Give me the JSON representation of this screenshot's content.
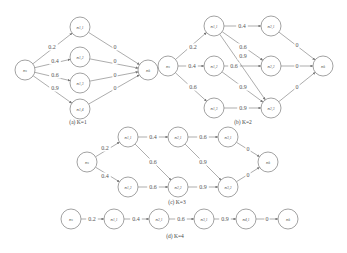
{
  "figure": {
    "node_radius": 10,
    "colors": {
      "stroke": "#8a8a8a",
      "text": "#555555",
      "background": "#ffffff"
    },
    "subfigures": [
      {
        "id": "a",
        "caption": "(a) K=1",
        "caption_pos": [
          78,
          124
        ],
        "nodes": [
          {
            "id": "ns",
            "label": "ns",
            "x": 25,
            "y": 70
          },
          {
            "id": "n11",
            "label": "n1,1",
            "x": 80,
            "y": 27
          },
          {
            "id": "n12",
            "label": "n1,2",
            "x": 80,
            "y": 57
          },
          {
            "id": "n13",
            "label": "n1,3",
            "x": 80,
            "y": 83
          },
          {
            "id": "n14",
            "label": "n1,4",
            "x": 80,
            "y": 109
          },
          {
            "id": "nk",
            "label": "nk",
            "x": 148,
            "y": 70
          }
        ],
        "edges": [
          {
            "from": "ns",
            "to": "n11",
            "label": "0.2",
            "lx": 52,
            "ly": 47
          },
          {
            "from": "ns",
            "to": "n12",
            "label": "0.4",
            "lx": 55,
            "ly": 61
          },
          {
            "from": "ns",
            "to": "n13",
            "label": "0.6",
            "lx": 55,
            "ly": 75
          },
          {
            "from": "ns",
            "to": "n14",
            "label": "0.9",
            "lx": 55,
            "ly": 88
          },
          {
            "from": "n11",
            "to": "nk",
            "label": "0",
            "lx": 115,
            "ly": 47
          },
          {
            "from": "n12",
            "to": "nk",
            "label": "0",
            "lx": 115,
            "ly": 61
          },
          {
            "from": "n13",
            "to": "nk",
            "label": "0",
            "lx": 115,
            "ly": 75
          },
          {
            "from": "n14",
            "to": "nk",
            "label": "0",
            "lx": 115,
            "ly": 88
          }
        ]
      },
      {
        "id": "b",
        "caption": "(b) K=2",
        "caption_pos": [
          243,
          124
        ],
        "nodes": [
          {
            "id": "ns",
            "label": "ns",
            "x": 168,
            "y": 66
          },
          {
            "id": "n11",
            "label": "n1,1",
            "x": 214,
            "y": 26
          },
          {
            "id": "n12",
            "label": "n1,2",
            "x": 214,
            "y": 66
          },
          {
            "id": "n13",
            "label": "n1,3",
            "x": 214,
            "y": 108
          },
          {
            "id": "n21",
            "label": "n2,1",
            "x": 271,
            "y": 26
          },
          {
            "id": "n22",
            "label": "n2,2",
            "x": 271,
            "y": 66
          },
          {
            "id": "n23",
            "label": "n2,3",
            "x": 271,
            "y": 108
          },
          {
            "id": "nk",
            "label": "nk",
            "x": 323,
            "y": 66
          }
        ],
        "edges": [
          {
            "from": "ns",
            "to": "n11",
            "label": "0.2",
            "lx": 193,
            "ly": 47
          },
          {
            "from": "ns",
            "to": "n12",
            "label": "0.4",
            "lx": 192,
            "ly": 66
          },
          {
            "from": "ns",
            "to": "n13",
            "label": "0.6",
            "lx": 193,
            "ly": 87
          },
          {
            "from": "n11",
            "to": "n21",
            "label": "0.4",
            "lx": 242,
            "ly": 26
          },
          {
            "from": "n11",
            "to": "n22",
            "label": "0.6",
            "lx": 243,
            "ly": 47
          },
          {
            "from": "n11",
            "to": "n23",
            "label": "0.9",
            "lx": 243,
            "ly": 56
          },
          {
            "from": "n12",
            "to": "n22",
            "label": "0.6",
            "lx": 234,
            "ly": 66
          },
          {
            "from": "n12",
            "to": "n23",
            "label": "0.9",
            "lx": 243,
            "ly": 87
          },
          {
            "from": "n13",
            "to": "n23",
            "label": "0.9",
            "lx": 243,
            "ly": 108
          },
          {
            "from": "n21",
            "to": "nk",
            "label": "0",
            "lx": 297,
            "ly": 45
          },
          {
            "from": "n22",
            "to": "nk",
            "label": "0",
            "lx": 297,
            "ly": 66
          },
          {
            "from": "n23",
            "to": "nk",
            "label": "0",
            "lx": 297,
            "ly": 87
          }
        ]
      },
      {
        "id": "c",
        "caption": "(c) K=3",
        "caption_pos": [
          177,
          204
        ],
        "nodes": [
          {
            "id": "ns",
            "label": "ns",
            "x": 87,
            "y": 162
          },
          {
            "id": "n11",
            "label": "n1,1",
            "x": 128,
            "y": 137
          },
          {
            "id": "n12",
            "label": "n1,2",
            "x": 128,
            "y": 187
          },
          {
            "id": "n21",
            "label": "n2,1",
            "x": 178,
            "y": 137
          },
          {
            "id": "n22",
            "label": "n2,2",
            "x": 178,
            "y": 187
          },
          {
            "id": "n31",
            "label": "n3,1",
            "x": 228,
            "y": 137
          },
          {
            "id": "n32",
            "label": "n3,2",
            "x": 228,
            "y": 187
          },
          {
            "id": "nk",
            "label": "nk",
            "x": 268,
            "y": 162
          }
        ],
        "edges": [
          {
            "from": "ns",
            "to": "n11",
            "label": "0.2",
            "lx": 105,
            "ly": 148
          },
          {
            "from": "ns",
            "to": "n12",
            "label": "0.4",
            "lx": 105,
            "ly": 176
          },
          {
            "from": "n11",
            "to": "n21",
            "label": "0.4",
            "lx": 153,
            "ly": 137
          },
          {
            "from": "n11",
            "to": "n22",
            "label": "0.6",
            "lx": 153,
            "ly": 162
          },
          {
            "from": "n12",
            "to": "n22",
            "label": "0.6",
            "lx": 153,
            "ly": 187
          },
          {
            "from": "n21",
            "to": "n31",
            "label": "0.6",
            "lx": 203,
            "ly": 137
          },
          {
            "from": "n21",
            "to": "n32",
            "label": "0.9",
            "lx": 203,
            "ly": 162
          },
          {
            "from": "n22",
            "to": "n32",
            "label": "0.9",
            "lx": 203,
            "ly": 187
          },
          {
            "from": "n31",
            "to": "nk",
            "label": "0",
            "lx": 248,
            "ly": 149
          },
          {
            "from": "n32",
            "to": "nk",
            "label": "0",
            "lx": 248,
            "ly": 175
          }
        ]
      },
      {
        "id": "d",
        "caption": "(d) K=4",
        "caption_pos": [
          175,
          238
        ],
        "nodes": [
          {
            "id": "ns",
            "label": "ns",
            "x": 71,
            "y": 219
          },
          {
            "id": "n11",
            "label": "n1,1",
            "x": 114,
            "y": 219
          },
          {
            "id": "n21",
            "label": "n2,1",
            "x": 159,
            "y": 219
          },
          {
            "id": "n31",
            "label": "n3,1",
            "x": 204,
            "y": 219
          },
          {
            "id": "n41",
            "label": "n4,1",
            "x": 246,
            "y": 219
          },
          {
            "id": "nk",
            "label": "nk",
            "x": 288,
            "y": 219
          }
        ],
        "edges": [
          {
            "from": "ns",
            "to": "n11",
            "label": "0.2",
            "lx": 92,
            "ly": 219
          },
          {
            "from": "n11",
            "to": "n21",
            "label": "0.4",
            "lx": 136,
            "ly": 219
          },
          {
            "from": "n21",
            "to": "n31",
            "label": "0.6",
            "lx": 181,
            "ly": 219
          },
          {
            "from": "n31",
            "to": "n41",
            "label": "0.9",
            "lx": 225,
            "ly": 219
          },
          {
            "from": "n41",
            "to": "nk",
            "label": "0",
            "lx": 267,
            "ly": 219
          }
        ]
      }
    ]
  }
}
